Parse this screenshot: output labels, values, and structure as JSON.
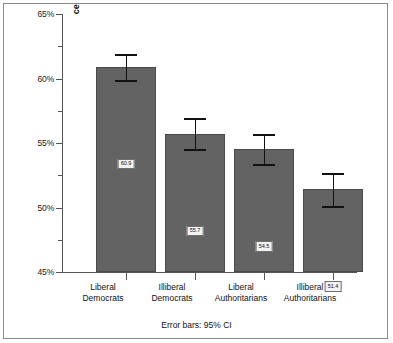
{
  "chart_data": {
    "type": "bar",
    "title": "",
    "xlabel": "",
    "ylabel": "Mean Scale of Political Tolerance",
    "ylim": [
      45,
      65
    ],
    "ytick_labels": [
      "65%",
      "60%",
      "55%",
      "50%",
      "45%"
    ],
    "ytick_values": [
      65,
      60,
      55,
      50,
      45
    ],
    "yminor_values": [
      62.5,
      57.5,
      52.5,
      47.5
    ],
    "grid": false,
    "legend": "none",
    "annotation": "Error bars: 95% CI",
    "categories": [
      "Liberal\nDemocrats",
      "Illiberal\nDemocrats",
      "Liberal\nAuthoritarians",
      "Illiberal\nAuthoritarians"
    ],
    "category_lines": [
      [
        "Liberal",
        "Democrats"
      ],
      [
        "Illiberal",
        "Democrats"
      ],
      [
        "Liberal",
        "Authoritarians"
      ],
      [
        "Illiberal",
        "Authoritarians"
      ]
    ],
    "values": [
      60.9,
      55.7,
      54.5,
      51.4
    ],
    "value_labels": [
      "60.9",
      "55.7",
      "54.5",
      "51.4"
    ],
    "ci_low": [
      59.9,
      54.5,
      53.4,
      50.1
    ],
    "ci_high": [
      61.9,
      56.9,
      55.7,
      52.7
    ],
    "bar_color": "#636363",
    "error_color": "#111111"
  },
  "footer": {
    "note": "Error bars: 95% CI"
  }
}
